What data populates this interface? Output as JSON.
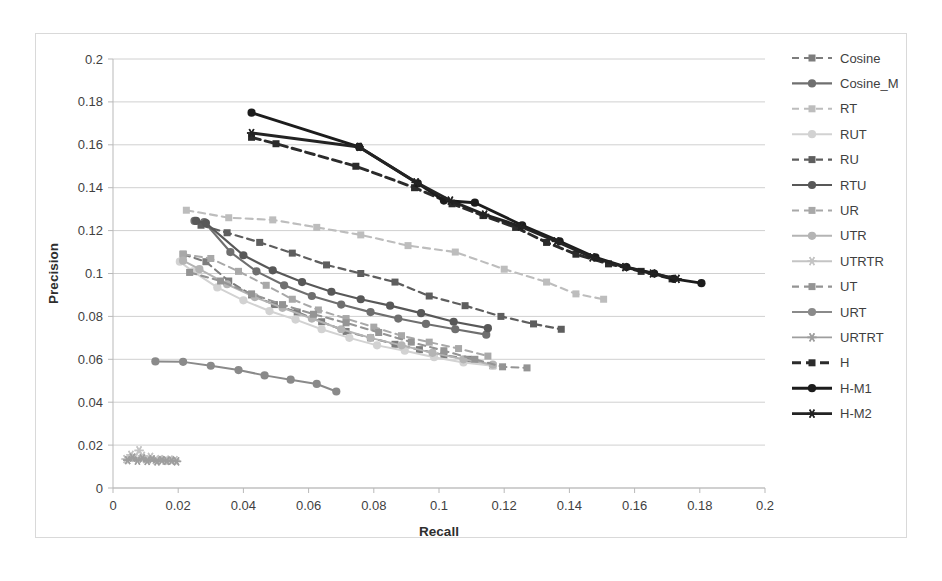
{
  "chart_data": {
    "type": "line",
    "title": "",
    "xlabel": "Recall",
    "ylabel": "Precision",
    "xlim": [
      0,
      0.2
    ],
    "ylim": [
      0,
      0.2
    ],
    "xticks": [
      "0",
      "0.02",
      "0.04",
      "0.06",
      "0.08",
      "0.1",
      "0.12",
      "0.14",
      "0.16",
      "0.18",
      "0.2"
    ],
    "yticks": [
      "0",
      "0.02",
      "0.04",
      "0.06",
      "0.08",
      "0.1",
      "0.12",
      "0.14",
      "0.16",
      "0.18",
      "0.2"
    ],
    "xtick_values": [
      0,
      0.02,
      0.04,
      0.06,
      0.08,
      0.1,
      0.12,
      0.14,
      0.16,
      0.18,
      0.2
    ],
    "ytick_values": [
      0,
      0.02,
      0.04,
      0.06,
      0.08,
      0.1,
      0.12,
      0.14,
      0.16,
      0.18,
      0.2
    ],
    "grid": "horizontal",
    "legend_position": "right",
    "series": [
      {
        "name": "Cosine",
        "color": "#7d7d7d",
        "dash": "7,5",
        "width": 2.1,
        "marker": "square",
        "points": [
          [
            0.0215,
            0.109
          ],
          [
            0.0285,
            0.1055
          ],
          [
            0.0355,
            0.0965
          ],
          [
            0.0425,
            0.09
          ],
          [
            0.0495,
            0.0855
          ],
          [
            0.0565,
            0.082
          ],
          [
            0.064,
            0.0775
          ],
          [
            0.0715,
            0.073
          ],
          [
            0.079,
            0.07
          ],
          [
            0.0865,
            0.067
          ],
          [
            0.094,
            0.0645
          ],
          [
            0.1015,
            0.062
          ],
          [
            0.109,
            0.06
          ],
          [
            0.1165,
            0.057
          ]
        ]
      },
      {
        "name": "Cosine_M",
        "color": "#6f6f6f",
        "dash": "none",
        "width": 2.1,
        "marker": "circle",
        "points": [
          [
            0.025,
            0.1245
          ],
          [
            0.028,
            0.124
          ],
          [
            0.036,
            0.11
          ],
          [
            0.044,
            0.101
          ],
          [
            0.0525,
            0.0945
          ],
          [
            0.061,
            0.0895
          ],
          [
            0.07,
            0.0855
          ],
          [
            0.079,
            0.082
          ],
          [
            0.0875,
            0.079
          ],
          [
            0.096,
            0.0765
          ],
          [
            0.105,
            0.074
          ],
          [
            0.1145,
            0.0715
          ]
        ]
      },
      {
        "name": "RT",
        "color": "#bdbdbd",
        "dash": "7,5",
        "width": 2.1,
        "marker": "square",
        "points": [
          [
            0.0225,
            0.1295
          ],
          [
            0.0355,
            0.126
          ],
          [
            0.049,
            0.125
          ],
          [
            0.0625,
            0.1215
          ],
          [
            0.076,
            0.118
          ],
          [
            0.0905,
            0.113
          ],
          [
            0.105,
            0.11
          ],
          [
            0.12,
            0.102
          ],
          [
            0.133,
            0.096
          ],
          [
            0.142,
            0.0905
          ],
          [
            0.1505,
            0.088
          ]
        ]
      },
      {
        "name": "RUT",
        "color": "#d2d2d2",
        "dash": "none",
        "width": 2.0,
        "marker": "circle",
        "points": [
          [
            0.0205,
            0.1055
          ],
          [
            0.0245,
            0.101
          ],
          [
            0.032,
            0.0935
          ],
          [
            0.04,
            0.0875
          ],
          [
            0.048,
            0.0825
          ],
          [
            0.056,
            0.0785
          ],
          [
            0.064,
            0.074
          ],
          [
            0.0725,
            0.07
          ],
          [
            0.081,
            0.0665
          ],
          [
            0.0895,
            0.064
          ],
          [
            0.0985,
            0.061
          ],
          [
            0.1075,
            0.0585
          ],
          [
            0.1165,
            0.057
          ]
        ]
      },
      {
        "name": "RU",
        "color": "#5e5e5e",
        "dash": "7,5",
        "width": 2.2,
        "marker": "square",
        "points": [
          [
            0.027,
            0.1225
          ],
          [
            0.035,
            0.119
          ],
          [
            0.045,
            0.1145
          ],
          [
            0.055,
            0.1095
          ],
          [
            0.0655,
            0.104
          ],
          [
            0.076,
            0.1
          ],
          [
            0.0865,
            0.096
          ],
          [
            0.097,
            0.0895
          ],
          [
            0.108,
            0.085
          ],
          [
            0.119,
            0.08
          ],
          [
            0.129,
            0.0765
          ],
          [
            0.1375,
            0.074
          ]
        ]
      },
      {
        "name": "RTU",
        "color": "#585858",
        "dash": "none",
        "width": 2.2,
        "marker": "circle",
        "points": [
          [
            0.0255,
            0.1245
          ],
          [
            0.0285,
            0.1235
          ],
          [
            0.04,
            0.1085
          ],
          [
            0.049,
            0.1015
          ],
          [
            0.058,
            0.096
          ],
          [
            0.067,
            0.0915
          ],
          [
            0.076,
            0.088
          ],
          [
            0.085,
            0.085
          ],
          [
            0.0945,
            0.0815
          ],
          [
            0.1045,
            0.0775
          ],
          [
            0.115,
            0.0745
          ]
        ]
      },
      {
        "name": "UR",
        "color": "#a8a8a8",
        "dash": "7,5",
        "width": 2.0,
        "marker": "square",
        "points": [
          [
            0.0215,
            0.109
          ],
          [
            0.03,
            0.107
          ],
          [
            0.0385,
            0.101
          ],
          [
            0.047,
            0.0945
          ],
          [
            0.055,
            0.088
          ],
          [
            0.063,
            0.083
          ],
          [
            0.0715,
            0.079
          ],
          [
            0.08,
            0.075
          ],
          [
            0.0885,
            0.071
          ],
          [
            0.097,
            0.068
          ],
          [
            0.106,
            0.065
          ],
          [
            0.115,
            0.0615
          ]
        ]
      },
      {
        "name": "UTR",
        "color": "#b4b4b4",
        "dash": "none",
        "width": 2.0,
        "marker": "circle",
        "points": [
          [
            0.0215,
            0.106
          ],
          [
            0.0265,
            0.102
          ],
          [
            0.035,
            0.095
          ],
          [
            0.0435,
            0.089
          ],
          [
            0.052,
            0.084
          ],
          [
            0.061,
            0.079
          ],
          [
            0.07,
            0.074
          ],
          [
            0.079,
            0.07
          ],
          [
            0.0885,
            0.0665
          ],
          [
            0.098,
            0.063
          ],
          [
            0.1075,
            0.06
          ],
          [
            0.1165,
            0.0575
          ]
        ]
      },
      {
        "name": "UTRTR",
        "color": "#c4c4c4",
        "dash": "none",
        "width": 1.9,
        "marker": "star",
        "points": [
          [
            0.004,
            0.0135
          ],
          [
            0.0055,
            0.0155
          ],
          [
            0.0065,
            0.014
          ],
          [
            0.008,
            0.0175
          ],
          [
            0.009,
            0.015
          ],
          [
            0.01,
            0.0135
          ],
          [
            0.0115,
            0.0145
          ],
          [
            0.013,
            0.013
          ],
          [
            0.0145,
            0.0135
          ],
          [
            0.016,
            0.0128
          ],
          [
            0.0175,
            0.0132
          ],
          [
            0.019,
            0.013
          ]
        ]
      },
      {
        "name": "UT",
        "color": "#949494",
        "dash": "7,5",
        "width": 2.1,
        "marker": "square",
        "points": [
          [
            0.0235,
            0.1005
          ],
          [
            0.033,
            0.0965
          ],
          [
            0.0425,
            0.0905
          ],
          [
            0.052,
            0.0855
          ],
          [
            0.0615,
            0.081
          ],
          [
            0.0715,
            0.077
          ],
          [
            0.0815,
            0.0725
          ],
          [
            0.0915,
            0.068
          ],
          [
            0.1015,
            0.064
          ],
          [
            0.111,
            0.06
          ],
          [
            0.1195,
            0.0565
          ],
          [
            0.127,
            0.056
          ]
        ]
      },
      {
        "name": "URT",
        "color": "#8a8a8a",
        "dash": "none",
        "width": 2.0,
        "marker": "circle",
        "points": [
          [
            0.013,
            0.059
          ],
          [
            0.0215,
            0.0588
          ],
          [
            0.03,
            0.057
          ],
          [
            0.0385,
            0.055
          ],
          [
            0.0465,
            0.0525
          ],
          [
            0.0545,
            0.0505
          ],
          [
            0.0625,
            0.0485
          ],
          [
            0.0685,
            0.045
          ]
        ]
      },
      {
        "name": "URTRT",
        "color": "#9e9e9e",
        "dash": "none",
        "width": 1.9,
        "marker": "star",
        "points": [
          [
            0.0045,
            0.013
          ],
          [
            0.006,
            0.0142
          ],
          [
            0.0075,
            0.0128
          ],
          [
            0.009,
            0.0138
          ],
          [
            0.0105,
            0.0126
          ],
          [
            0.012,
            0.0134
          ],
          [
            0.0135,
            0.0124
          ],
          [
            0.015,
            0.013
          ],
          [
            0.0165,
            0.0126
          ],
          [
            0.018,
            0.0128
          ],
          [
            0.0195,
            0.0124
          ]
        ]
      },
      {
        "name": "H",
        "color": "#2b2b2b",
        "dash": "9,5",
        "width": 2.9,
        "marker": "square",
        "points": [
          [
            0.0425,
            0.1635
          ],
          [
            0.05,
            0.1605
          ],
          [
            0.0745,
            0.15
          ],
          [
            0.0925,
            0.14
          ],
          [
            0.104,
            0.1325
          ],
          [
            0.1135,
            0.127
          ],
          [
            0.1235,
            0.1215
          ],
          [
            0.133,
            0.1145
          ],
          [
            0.142,
            0.109
          ],
          [
            0.152,
            0.1045
          ],
          [
            0.162,
            0.101
          ],
          [
            0.1715,
            0.0975
          ]
        ]
      },
      {
        "name": "H-M1",
        "color": "#1c1c1c",
        "dash": "none",
        "width": 2.9,
        "marker": "circle",
        "points": [
          [
            0.0425,
            0.175
          ],
          [
            0.0755,
            0.159
          ],
          [
            0.0935,
            0.142
          ],
          [
            0.1015,
            0.134
          ],
          [
            0.111,
            0.133
          ],
          [
            0.1255,
            0.1225
          ],
          [
            0.137,
            0.115
          ],
          [
            0.148,
            0.1075
          ],
          [
            0.1575,
            0.103
          ],
          [
            0.166,
            0.1
          ],
          [
            0.172,
            0.0975
          ],
          [
            0.1805,
            0.0955
          ]
        ]
      },
      {
        "name": "H-M2",
        "color": "#232323",
        "dash": "none",
        "width": 2.9,
        "marker": "star",
        "points": [
          [
            0.0425,
            0.1655
          ],
          [
            0.0755,
            0.159
          ],
          [
            0.093,
            0.1425
          ],
          [
            0.1035,
            0.134
          ],
          [
            0.114,
            0.1275
          ],
          [
            0.125,
            0.122
          ],
          [
            0.136,
            0.115
          ],
          [
            0.147,
            0.1075
          ],
          [
            0.157,
            0.103
          ],
          [
            0.1655,
            0.1
          ],
          [
            0.173,
            0.0975
          ]
        ]
      }
    ]
  },
  "legend": {
    "items": [
      {
        "label": "Cosine"
      },
      {
        "label": "Cosine_M"
      },
      {
        "label": "RT"
      },
      {
        "label": "RUT"
      },
      {
        "label": "RU"
      },
      {
        "label": "RTU"
      },
      {
        "label": "UR"
      },
      {
        "label": "UTR"
      },
      {
        "label": "UTRTR"
      },
      {
        "label": "UT"
      },
      {
        "label": "URT"
      },
      {
        "label": "URTRT"
      },
      {
        "label": "H"
      },
      {
        "label": "H-M1"
      },
      {
        "label": "H-M2"
      }
    ]
  }
}
